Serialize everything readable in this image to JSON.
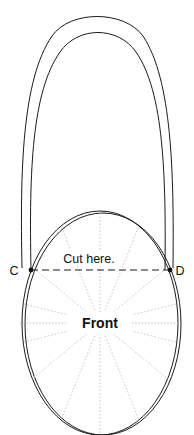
{
  "figure": {
    "background_color": "#ffffff",
    "stroke_color": "#1a1a1a",
    "guide_color": "#b9b9b9",
    "width": 194,
    "height": 435
  },
  "labels": {
    "point_c": "C",
    "point_d": "D",
    "cut_here": "Cut here.",
    "front": "Front"
  },
  "geometry": {
    "center": {
      "x": 100,
      "y": 323
    },
    "ellipse_rx": 78,
    "ellipse_ry": 112,
    "point_c": {
      "x": 31,
      "y": 270
    },
    "point_d": {
      "x": 170,
      "y": 270
    },
    "spoke_count": 12,
    "cut_line_style": "dashed",
    "front_axis_style": "dotted"
  }
}
